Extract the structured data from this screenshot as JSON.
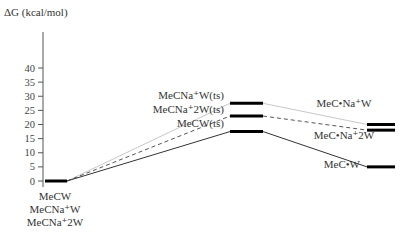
{
  "chart_data": {
    "type": "energy-level-diagram",
    "title": "",
    "ylabel": "ΔG (kcal/mol)",
    "xlabel": "",
    "ylim": [
      0,
      40
    ],
    "yticks": [
      0,
      5,
      10,
      15,
      20,
      25,
      30,
      35,
      40
    ],
    "grid": false,
    "legend": null,
    "stages": [
      "reactant",
      "transition-state",
      "product"
    ],
    "reactant": {
      "value": 0,
      "labels": [
        "MeCW",
        "MeCNa⁺W",
        "MeCNa⁺2W"
      ]
    },
    "series": [
      {
        "name": "MeCNa+W",
        "style": "solid-light",
        "color": "#c8c8c8",
        "values": [
          0,
          27.5,
          20.0
        ],
        "labels": [
          "MeCNa⁺W",
          "MeCNa⁺W(ts)",
          "MeC•Na⁺W"
        ]
      },
      {
        "name": "MeCNa+2W",
        "style": "dashed",
        "color": "#555555",
        "values": [
          0,
          23.0,
          18.0
        ],
        "labels": [
          "MeCNa⁺2W",
          "MeCNa⁺2W(ts)",
          "MeC•Na⁺2W"
        ]
      },
      {
        "name": "MeCW",
        "style": "solid",
        "color": "#333333",
        "values": [
          0,
          17.5,
          5.0
        ],
        "labels": [
          "MeCW",
          "MeCW(ts)",
          "MeC•W"
        ]
      }
    ]
  },
  "axis": {
    "label": "ΔG (kcal/mol)",
    "ticks": [
      "0",
      "5",
      "10",
      "15",
      "20",
      "25",
      "30",
      "35",
      "40"
    ]
  },
  "labels": {
    "reactant": [
      "MeCW",
      "MeCNa⁺W",
      "MeCNa⁺2W"
    ],
    "ts": {
      "na_w": "MeCNa⁺W(ts)",
      "na_2w": "MeCNa⁺2W(ts)",
      "w": "MeCW(ts)"
    },
    "product": {
      "na_w": "MeC•Na⁺W",
      "na_2w": "MeC•Na⁺2W",
      "w": "MeC•W"
    }
  },
  "colors": {
    "axis": "#555555",
    "bar": "#000000",
    "line_light": "#c8c8c8",
    "line_dashed": "#555555",
    "line_solid": "#333333"
  }
}
